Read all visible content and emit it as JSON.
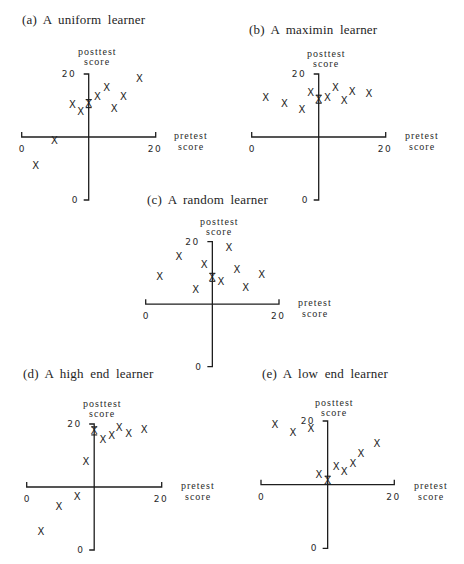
{
  "chart_data": [
    {
      "id": "a",
      "type": "scatter",
      "title": "(a) A uniform learner",
      "xlabel": [
        "pretest",
        "score"
      ],
      "ylabel": [
        "posttest",
        "score"
      ],
      "x_ticks": [
        "0",
        "20"
      ],
      "y_ticks": [
        "20",
        "0"
      ],
      "xlim": [
        0,
        20
      ],
      "ylim": [
        0,
        20
      ],
      "axes_cross_at": [
        10,
        10
      ],
      "marker": "X",
      "points": [
        {
          "x": 2.1,
          "y": 5.5
        },
        {
          "x": 4.9,
          "y": 9.5
        },
        {
          "x": 7.6,
          "y": 15.2
        },
        {
          "x": 8.8,
          "y": 14.0
        },
        {
          "x": 10.0,
          "y": 15.3,
          "on_axis": true
        },
        {
          "x": 11.3,
          "y": 16.4
        },
        {
          "x": 12.7,
          "y": 17.9
        },
        {
          "x": 13.8,
          "y": 14.6
        },
        {
          "x": 15.2,
          "y": 16.4
        },
        {
          "x": 17.6,
          "y": 19.3
        }
      ]
    },
    {
      "id": "b",
      "type": "scatter",
      "title": "(b) A maximin learner",
      "xlabel": [
        "pretest",
        "score"
      ],
      "ylabel": [
        "posttest",
        "score"
      ],
      "x_ticks": [
        "0",
        "20"
      ],
      "y_ticks": [
        "20",
        "0"
      ],
      "xlim": [
        0,
        20
      ],
      "ylim": [
        0,
        20
      ],
      "axes_cross_at": [
        10,
        10
      ],
      "marker": "X",
      "points": [
        {
          "x": 2.1,
          "y": 16.3
        },
        {
          "x": 4.9,
          "y": 15.3
        },
        {
          "x": 7.5,
          "y": 14.3
        },
        {
          "x": 8.8,
          "y": 17.0
        },
        {
          "x": 10.0,
          "y": 16.0,
          "on_axis": true
        },
        {
          "x": 11.3,
          "y": 16.3
        },
        {
          "x": 12.5,
          "y": 17.9
        },
        {
          "x": 13.8,
          "y": 15.8
        },
        {
          "x": 15.0,
          "y": 17.3
        },
        {
          "x": 17.5,
          "y": 16.9
        }
      ]
    },
    {
      "id": "c",
      "type": "scatter",
      "title": "(c) A random learner",
      "xlabel": [
        "pretest",
        "score"
      ],
      "ylabel": [
        "posttest",
        "score"
      ],
      "x_ticks": [
        "0",
        "20"
      ],
      "y_ticks": [
        "20",
        "0"
      ],
      "xlim": [
        0,
        20
      ],
      "ylim": [
        0,
        20
      ],
      "axes_cross_at": [
        10,
        10
      ],
      "marker": "X",
      "points": [
        {
          "x": 2.1,
          "y": 14.5
        },
        {
          "x": 5.0,
          "y": 17.6
        },
        {
          "x": 7.5,
          "y": 12.3
        },
        {
          "x": 8.8,
          "y": 16.4
        },
        {
          "x": 10.0,
          "y": 14.3,
          "on_axis": true
        },
        {
          "x": 11.3,
          "y": 13.7
        },
        {
          "x": 12.5,
          "y": 19.0
        },
        {
          "x": 13.7,
          "y": 15.6
        },
        {
          "x": 15.0,
          "y": 12.6
        },
        {
          "x": 17.4,
          "y": 14.7
        }
      ]
    },
    {
      "id": "d",
      "type": "scatter",
      "title": "(d) A high end learner",
      "xlabel": [
        "pretest",
        "score"
      ],
      "ylabel": [
        "posttest",
        "score"
      ],
      "x_ticks": [
        "0",
        "20"
      ],
      "y_ticks": [
        "20",
        "0"
      ],
      "xlim": [
        0,
        20
      ],
      "ylim": [
        0,
        20
      ],
      "axes_cross_at": [
        10,
        10
      ],
      "marker": "X",
      "points": [
        {
          "x": 2.1,
          "y": 2.9
        },
        {
          "x": 4.8,
          "y": 6.9
        },
        {
          "x": 7.5,
          "y": 8.5
        },
        {
          "x": 8.8,
          "y": 14.0
        },
        {
          "x": 10.0,
          "y": 18.9,
          "on_axis": true
        },
        {
          "x": 11.3,
          "y": 17.6
        },
        {
          "x": 12.6,
          "y": 18.1
        },
        {
          "x": 13.7,
          "y": 19.4
        },
        {
          "x": 15.1,
          "y": 18.5
        },
        {
          "x": 17.4,
          "y": 19.2
        }
      ]
    },
    {
      "id": "e",
      "type": "scatter",
      "title": "(e) A low end learner",
      "xlabel": [
        "pretest",
        "score"
      ],
      "ylabel": [
        "posttest",
        "score"
      ],
      "x_ticks": [
        "0",
        "20"
      ],
      "y_ticks": [
        "20",
        "0"
      ],
      "xlim": [
        0,
        20
      ],
      "ylim": [
        0,
        20
      ],
      "axes_cross_at": [
        10,
        10
      ],
      "marker": "X",
      "points": [
        {
          "x": 2.1,
          "y": 19.5
        },
        {
          "x": 4.8,
          "y": 18.2
        },
        {
          "x": 7.5,
          "y": 18.8
        },
        {
          "x": 8.7,
          "y": 11.6
        },
        {
          "x": 10.0,
          "y": 10.7,
          "on_axis": true
        },
        {
          "x": 11.3,
          "y": 12.8
        },
        {
          "x": 12.5,
          "y": 12.1
        },
        {
          "x": 13.8,
          "y": 13.4
        },
        {
          "x": 15.0,
          "y": 14.9
        },
        {
          "x": 17.4,
          "y": 16.4
        }
      ]
    }
  ],
  "panels": {
    "a": {
      "title": "(a) A uniform learner",
      "posttest": "posttest",
      "score": "score",
      "pretest": "pretest",
      "y_top": "20",
      "y_bottom": "0",
      "x_left": "0",
      "x_right": "20"
    },
    "b": {
      "title": "(b) A maximin learner",
      "posttest": "posttest",
      "score": "score",
      "pretest": "pretest",
      "y_top": "20",
      "y_bottom": "0",
      "x_left": "0",
      "x_right": "20"
    },
    "c": {
      "title": "(c) A random learner",
      "posttest": "posttest",
      "score": "score",
      "pretest": "pretest",
      "y_top": "20",
      "y_bottom": "0",
      "x_left": "0",
      "x_right": "20"
    },
    "d": {
      "title": "(d) A high end learner",
      "posttest": "posttest",
      "score": "score",
      "pretest": "pretest",
      "y_top": "20",
      "y_bottom": "0",
      "x_left": "0",
      "x_right": "20"
    },
    "e": {
      "title": "(e) A low end learner",
      "posttest": "posttest",
      "score": "score",
      "pretest": "pretest",
      "y_top": "20",
      "y_bottom": "0",
      "x_left": "0",
      "x_right": "20"
    }
  },
  "marker_glyph": "X"
}
